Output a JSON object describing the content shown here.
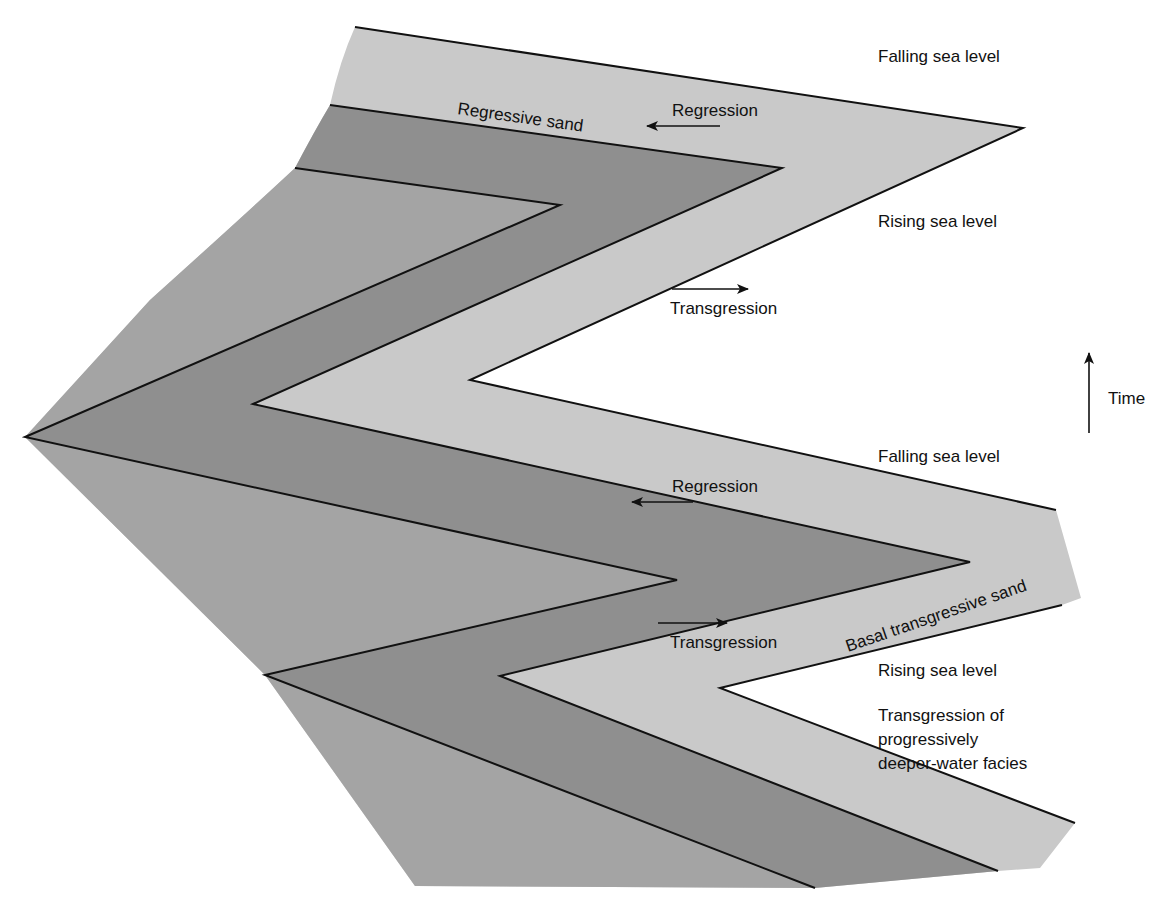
{
  "diagram": {
    "type": "sequence-stratigraphy-cross-section",
    "colors": {
      "background": "#ffffff",
      "shallow_light_band": "#c9c9c9",
      "sand_dark_band": "#8f8f8f",
      "offshore_mid_band": "#a4a4a4",
      "lines": "#111111"
    },
    "labels": {
      "falling_sea_level_top": "Falling sea level",
      "rising_sea_level_top": "Rising sea level",
      "falling_sea_level_bottom": "Falling sea level",
      "rising_sea_level_bottom": "Rising sea level",
      "regressive_sand": "Regressive sand",
      "regression_top": "Regression",
      "transgression_top": "Transgression",
      "regression_bottom": "Regression",
      "transgression_bottom": "Transgression",
      "basal_transgressive_sand": "Basal transgressive sand",
      "transgression_of_line1": "Transgression of",
      "transgression_of_line2": "progressively",
      "transgression_of_line3": "deeper-water facies",
      "time": "Time"
    },
    "arrows": [
      {
        "name": "regression-arrow-top",
        "direction": "left"
      },
      {
        "name": "transgression-arrow-top",
        "direction": "right"
      },
      {
        "name": "regression-arrow-bottom",
        "direction": "left"
      },
      {
        "name": "transgression-arrow-bottom",
        "direction": "right"
      },
      {
        "name": "time-arrow",
        "direction": "up"
      }
    ]
  }
}
